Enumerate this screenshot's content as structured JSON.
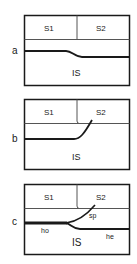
{
  "panels": [
    {
      "id": "a",
      "label": "a",
      "regions": {
        "s1": "S1",
        "s2": "S2",
        "is": "IS"
      }
    },
    {
      "id": "b",
      "label": "b",
      "regions": {
        "s1": "S1",
        "s2": "S2",
        "is": "IS"
      }
    },
    {
      "id": "c",
      "label": "c",
      "regions": {
        "s1": "S1",
        "s2": "S2",
        "is": "IS"
      },
      "annotations": {
        "ho": "ho",
        "sp": "sp",
        "he": "he"
      }
    }
  ],
  "colors": {
    "line": "#1a1a1a",
    "background": "#ffffff",
    "divider": "#555555"
  }
}
